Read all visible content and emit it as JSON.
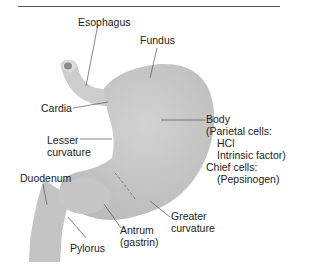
{
  "diagram": {
    "fill_color": "#c8c8c8",
    "labels": {
      "esophagus": "Esophagus",
      "fundus": "Fundus",
      "cardia": "Cardia",
      "lesser_curvature_1": "Lesser",
      "lesser_curvature_2": "curvature",
      "body_1": "Body",
      "body_2": "(Parietal cells:",
      "body_3": "HCl",
      "body_4": "Intrinsic factor)",
      "body_5": "Chief cells:",
      "body_6": "(Pepsinogen)",
      "duodenum": "Duodenum",
      "pylorus": "Pylorus",
      "antrum_1": "Antrum",
      "antrum_2": "(gastrin)",
      "greater_curvature_1": "Greater",
      "greater_curvature_2": "curvature"
    }
  }
}
